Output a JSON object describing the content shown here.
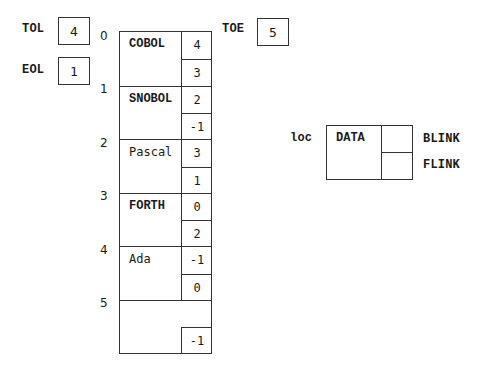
{
  "pointers": {
    "tol": {
      "label": "TOL",
      "value": "4"
    },
    "eol": {
      "label": "EOL",
      "value": "1"
    },
    "toe": {
      "label": "TOE",
      "value": "5"
    }
  },
  "table": {
    "rows": [
      {
        "index": "0",
        "data": "COBOL",
        "blink": "4",
        "flink": "3"
      },
      {
        "index": "1",
        "data": "SNOBOL",
        "blink": "2",
        "flink": "-1"
      },
      {
        "index": "2",
        "data": "Pascal",
        "blink": "3",
        "flink": "1"
      },
      {
        "index": "3",
        "data": "FORTH",
        "blink": "0",
        "flink": "2"
      },
      {
        "index": "4",
        "data": "Ada",
        "blink": "-1",
        "flink": "0"
      },
      {
        "index": "5",
        "data": "",
        "blink": "",
        "flink": "-1"
      }
    ]
  },
  "legend": {
    "loc_label": "loc",
    "data_label": "DATA",
    "blink_label": "BLINK",
    "flink_label": "FLINK"
  }
}
